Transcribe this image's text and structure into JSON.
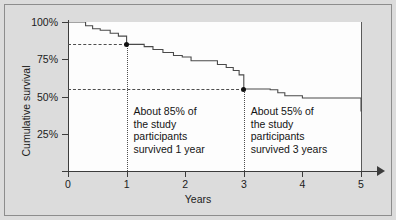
{
  "chart_data": {
    "type": "line",
    "subtype": "kaplan-meier-step",
    "title": "",
    "xlabel": "Years",
    "ylabel": "Cumulative survival",
    "xlim": [
      0,
      5
    ],
    "ylim": [
      0,
      1
    ],
    "grid": false,
    "legend": "none",
    "x_ticks": [
      0,
      1,
      2,
      3,
      4,
      5
    ],
    "x_tick_labels": [
      "0",
      "1",
      "2",
      "3",
      "4",
      "5"
    ],
    "y_ticks": [
      0.25,
      0.5,
      0.75,
      1.0
    ],
    "y_tick_labels": [
      "25%",
      "50%",
      "75%",
      "100%"
    ],
    "series": [
      {
        "name": "Cumulative survival",
        "step": "post",
        "x": [
          0.0,
          0.2,
          0.3,
          0.42,
          0.55,
          0.72,
          0.86,
          1.0,
          1.18,
          1.3,
          1.45,
          1.62,
          1.8,
          1.95,
          2.1,
          2.3,
          2.55,
          2.7,
          2.82,
          2.92,
          3.0,
          3.28,
          3.45,
          3.58,
          3.7,
          4.0,
          4.55,
          5.0
        ],
        "y": [
          1.0,
          1.0,
          0.975,
          0.955,
          0.945,
          0.925,
          0.905,
          0.85,
          0.85,
          0.835,
          0.815,
          0.795,
          0.775,
          0.765,
          0.74,
          0.74,
          0.715,
          0.695,
          0.675,
          0.645,
          0.55,
          0.55,
          0.545,
          0.525,
          0.505,
          0.49,
          0.49,
          0.4
        ],
        "y_labels": [
          "100%",
          "100%",
          "97.5%",
          "95.5%",
          "94.5%",
          "92.5%",
          "90.5%",
          "85%",
          "85%",
          "83.5%",
          "81.5%",
          "79.5%",
          "77.5%",
          "76.5%",
          "74%",
          "74%",
          "71.5%",
          "69.5%",
          "67.5%",
          "64.5%",
          "55%",
          "55%",
          "54.5%",
          "52.5%",
          "50.5%",
          "49%",
          "49%",
          "40%"
        ]
      }
    ],
    "markers": [
      {
        "name": "one-year-survival",
        "x": 1.0,
        "y": 0.85,
        "label": "85%"
      },
      {
        "name": "three-year-survival",
        "x": 3.0,
        "y": 0.55,
        "label": "55%"
      }
    ],
    "reference_lines": [
      {
        "name": "one-year-horizontal",
        "orientation": "horizontal",
        "value": 0.85,
        "style": "dashed",
        "from_x": 0,
        "to_x": 1.0
      },
      {
        "name": "one-year-vertical",
        "orientation": "vertical",
        "value": 1.0,
        "style": "dotted",
        "from_y": 0.0,
        "to_y": 0.85
      },
      {
        "name": "three-year-horizontal",
        "orientation": "horizontal",
        "value": 0.55,
        "style": "dashed",
        "from_x": 0,
        "to_x": 3.0
      },
      {
        "name": "three-year-vertical",
        "orientation": "vertical",
        "value": 3.0,
        "style": "dotted",
        "from_y": 0.0,
        "to_y": 0.55
      }
    ],
    "annotations": [
      {
        "name": "one-year-annotation",
        "text": "About 85% of\nthe study\nparticipants\nsurvived 1 year",
        "x": 1.05,
        "y": 0.4
      },
      {
        "name": "three-year-annotation",
        "text": "About 55% of\nthe study\nparticipants\nsurvived 3 years",
        "x": 3.05,
        "y": 0.4
      }
    ],
    "colors": {
      "curve": "#4a4a4a",
      "axis": "#3c3c3c",
      "guide": "#4d4d4d",
      "marker": "#111111",
      "panel_background": "#fdfdfd",
      "figure_background": "#dcdcdc",
      "frame_border": "#8d8d8d",
      "text": "#141414"
    }
  }
}
